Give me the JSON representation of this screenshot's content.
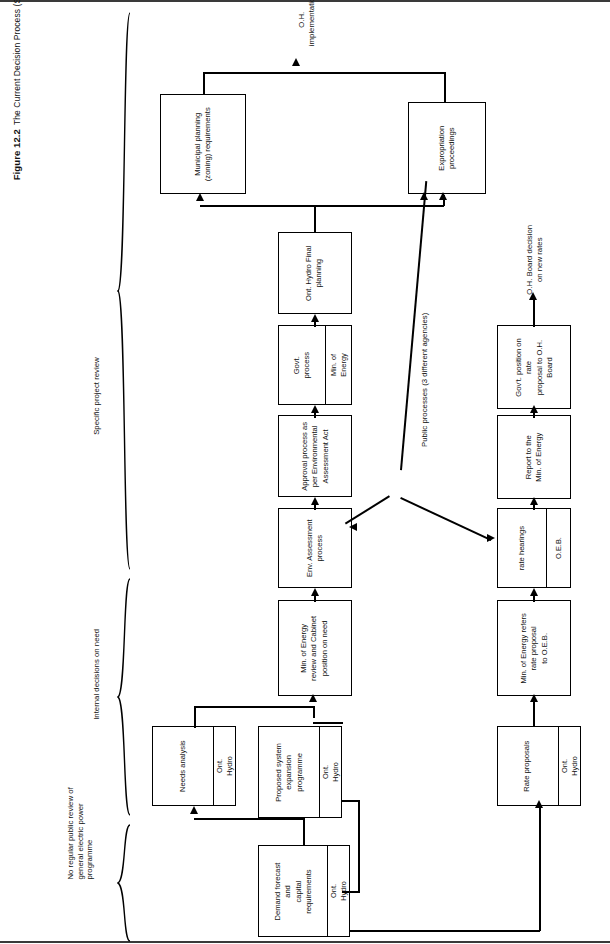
{
  "figure": {
    "number": "Figure 12.2",
    "title": "The Current Decision Process (Simplified)"
  },
  "phase_labels": [
    {
      "id": "no-review",
      "text": "No regular public review of\ngeneral electric power\nprogramme"
    },
    {
      "id": "internal",
      "text": "Internal decisions on need"
    },
    {
      "id": "specific",
      "text": "Specific project review"
    }
  ],
  "annotations": [
    {
      "id": "public-processes",
      "text": "Public processes (3 different agencies)"
    },
    {
      "id": "oh-implementation",
      "text": "O.H.\nimplementation"
    },
    {
      "id": "oh-board-decision",
      "text": "O.H. Board decision\non new rates"
    }
  ],
  "nodes": [
    {
      "id": "demand-forecast",
      "header": "Ont. Hydro",
      "body": "Demand forecast and\ncapital requirements"
    },
    {
      "id": "needs-analysis",
      "header": "Ont. Hydro",
      "body": "Needs analysis"
    },
    {
      "id": "proposed-system",
      "header": "Ont. Hydro",
      "body": "Proposed system\nexpansion programme"
    },
    {
      "id": "rate-proposals",
      "header": "Ont. Hydro",
      "body": "Rate proposals"
    },
    {
      "id": "min-energy-review",
      "header": "",
      "body": "Min. of Energy\nreview and Cabinet\nposition on need"
    },
    {
      "id": "env-assessment",
      "header": "",
      "body": "Env. Assessment\nprocess"
    },
    {
      "id": "approval-process",
      "header": "",
      "body": "Approval process as\nper Environmental\nAssessment Act"
    },
    {
      "id": "govt-process",
      "header": "Min. of\nEnergy",
      "body": "Govt.\nprocess"
    },
    {
      "id": "final-planning",
      "header": "",
      "body": "Ont. Hydro Final\nplanning"
    },
    {
      "id": "municipal-planning",
      "header": "",
      "body": "Municipal planning\n(zoning) requirements"
    },
    {
      "id": "expropriation",
      "header": "",
      "body": "Expropriation\nproceedings"
    },
    {
      "id": "min-energy-refers",
      "header": "",
      "body": "Min. of Energy refers\nrate proposal\nto O.E.B."
    },
    {
      "id": "oeb-rate-hearings",
      "header": "O.E.B.",
      "body": "rate hearings"
    },
    {
      "id": "report-min-energy",
      "header": "",
      "body": "Report to the\nMin. of Energy"
    },
    {
      "id": "govt-position-rate",
      "header": "",
      "body": "Gov't. position on rate\nproposal to O.H. Board"
    }
  ],
  "colors": {
    "line": "#000000",
    "rule": "#3a3a3a",
    "background": "#ffffff"
  }
}
